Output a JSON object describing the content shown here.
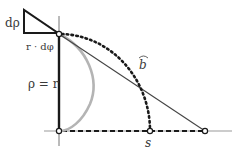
{
  "diagram": {
    "labels": {
      "d_rho": "dρ",
      "r_dphi": "r · dφ",
      "rho_eq_r": "ρ = r",
      "arc_b": "b",
      "s": "s"
    },
    "colors": {
      "ink": "#1a1a1a",
      "thin_line": "#555555",
      "gray_curve": "#b4b4b4",
      "label": "#3a3a3a"
    }
  }
}
